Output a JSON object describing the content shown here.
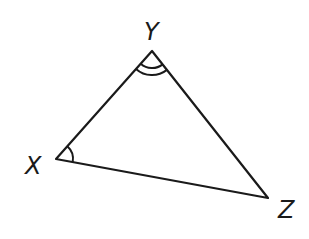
{
  "diagram": {
    "type": "triangle",
    "stroke_color": "#1a1a1a",
    "vertices": {
      "X": {
        "label": "X"
      },
      "Y": {
        "label": "Y"
      },
      "Z": {
        "label": "Z"
      }
    },
    "angle_marks": [
      {
        "vertex": "Y",
        "arcs": 2
      },
      {
        "vertex": "X",
        "arcs": 1
      }
    ]
  }
}
